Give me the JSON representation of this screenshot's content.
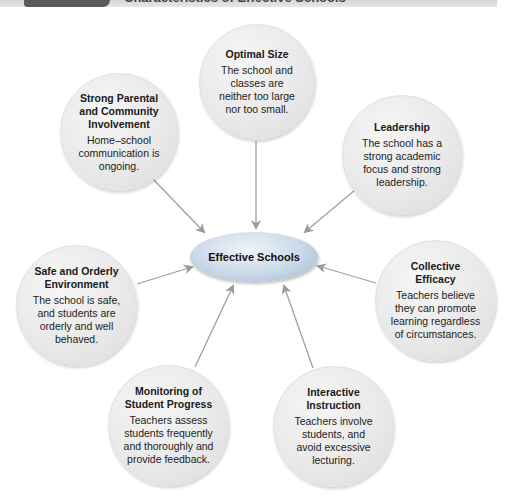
{
  "header": {
    "title": "Characteristics of Effective Schools"
  },
  "center": {
    "label": "Effective Schools",
    "fill": "#c9d9e8"
  },
  "colors": {
    "arrow": "#9a9a9a",
    "node_fill": "#e9e9e9",
    "header_tab": "#5a5a5a",
    "header_bar": "#dddddd"
  },
  "nodes": [
    {
      "id": "optimal-size",
      "title": "Optimal Size",
      "body": "The school and classes are neither too large nor too small."
    },
    {
      "id": "strong-parental",
      "title": "Strong Parental and Community Involvement",
      "body": "Home–school communication is ongoing."
    },
    {
      "id": "leadership",
      "title": "Leadership",
      "body": "The school has a strong academic focus and strong leadership."
    },
    {
      "id": "safe-orderly",
      "title": "Safe and Orderly Environment",
      "body": "The school is safe, and students are orderly and well behaved."
    },
    {
      "id": "collective-efficacy",
      "title": "Collective Efficacy",
      "body": "Teachers believe they can promote learning regardless of circumstances."
    },
    {
      "id": "monitoring",
      "title": "Monitoring of Student Progress",
      "body": "Teachers assess students frequently and thoroughly and provide feedback."
    },
    {
      "id": "interactive-instruction",
      "title": "Interactive Instruction",
      "body": "Teachers involve students, and avoid excessive lecturing."
    }
  ]
}
